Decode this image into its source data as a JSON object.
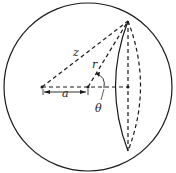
{
  "diagram": {
    "labels": {
      "z": "z",
      "r": "r",
      "a": "a",
      "theta": "θ"
    },
    "colors": {
      "stroke": "#1a1a1a",
      "background": "#ffffff"
    }
  }
}
